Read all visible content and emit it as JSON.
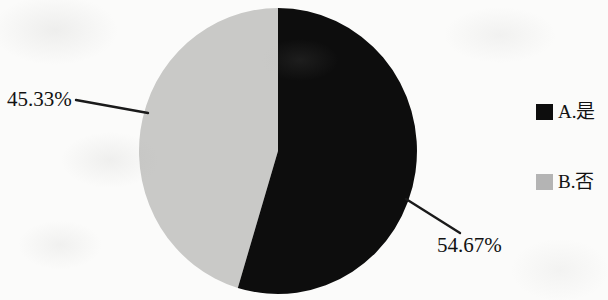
{
  "chart_data": {
    "type": "pie",
    "title": "",
    "subtitle": "",
    "xlabel": "",
    "ylabel": "",
    "categories": [
      "A.是",
      "B.否"
    ],
    "values": [
      54.67,
      45.33
    ],
    "labels": [
      "54.67%",
      "45.33%"
    ],
    "units": "percent",
    "total": 100,
    "legend_position": "right",
    "grid": false,
    "start_angle_deg": 0,
    "direction": "clockwise",
    "slices": [
      {
        "name": "A.是",
        "value": 54.67,
        "label": "54.67%",
        "color": "#0d0d0d",
        "start_deg": 0,
        "end_deg": 196.8,
        "leader_line": true
      },
      {
        "name": "B.否",
        "value": 45.33,
        "label": "45.33%",
        "color": "#c9c9c7",
        "start_deg": 196.8,
        "end_deg": 360,
        "leader_line": true
      }
    ]
  },
  "chart": {
    "pie": {
      "center_x": 278,
      "center_y": 151,
      "radius_x": 139,
      "radius_y": 143
    },
    "labels": {
      "gray_pct": "45.33%",
      "black_pct": "54.67%"
    },
    "colors": {
      "slice_a": "#0d0d0d",
      "slice_b": "#c9c9c7",
      "legend_a": "#0d0d0d",
      "legend_b": "#b4b4b4",
      "text": "#121212",
      "background": "#fbfbfa",
      "leader_line": "#1a1a1a"
    }
  },
  "legend": {
    "items": [
      {
        "key": "A",
        "label": "A.是",
        "swatch": "#0d0d0d"
      },
      {
        "key": "B",
        "label": "B.否",
        "swatch": "#b4b4b4"
      }
    ]
  }
}
